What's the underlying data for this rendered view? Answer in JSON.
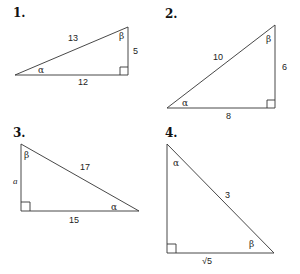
{
  "diagram": {
    "problems": [
      {
        "number": "1.",
        "vertices": {
          "alpha": [
            15,
            75
          ],
          "beta": [
            128,
            27
          ],
          "right": [
            128,
            75
          ]
        },
        "sides": {
          "hypotenuse": "13",
          "opposite_alpha": "5",
          "adjacent_alpha": "12"
        },
        "angles": {
          "alpha": "α",
          "beta": "β"
        }
      },
      {
        "number": "2.",
        "vertices": {
          "alpha": [
            167,
            108
          ],
          "beta": [
            275,
            25
          ],
          "right": [
            275,
            108
          ]
        },
        "sides": {
          "hypotenuse": "10",
          "opposite_alpha": "6",
          "adjacent_alpha": "8"
        },
        "angles": {
          "alpha": "α",
          "beta": "β"
        }
      },
      {
        "number": "3.",
        "vertices": {
          "beta": [
            21,
            144
          ],
          "right": [
            21,
            211
          ],
          "alpha": [
            139,
            211
          ]
        },
        "sides": {
          "hypotenuse": "17",
          "vertical": "a",
          "horizontal": "15"
        },
        "angles": {
          "alpha": "α",
          "beta": "β"
        }
      },
      {
        "number": "4.",
        "vertices": {
          "alpha": [
            167,
            144
          ],
          "right": [
            167,
            253
          ],
          "beta": [
            274,
            253
          ]
        },
        "sides": {
          "hypotenuse": "3",
          "horizontal": "√5"
        },
        "angles": {
          "alpha": "α",
          "beta": "β"
        }
      }
    ],
    "colors": {
      "stroke": "#333333",
      "text": "#222222",
      "background": "#ffffff"
    }
  }
}
